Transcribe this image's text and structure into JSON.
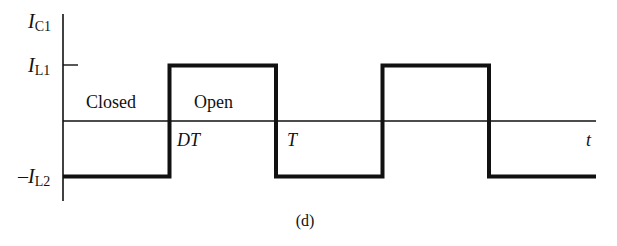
{
  "figure": {
    "caption": "(d)",
    "y_axis": {
      "title_main": "I",
      "title_sub": "C1",
      "levels": [
        {
          "name": "I_L1",
          "main": "I",
          "sub": "L1",
          "prefix": "",
          "value": 1
        },
        {
          "name": "-I_L2",
          "main": "I",
          "sub": "L2",
          "prefix": "–",
          "value": -1
        }
      ]
    },
    "x_axis": {
      "label": "t",
      "ticks": [
        {
          "label": "DT",
          "position": 0.5
        },
        {
          "label": "T",
          "position": 1.0
        }
      ]
    },
    "regions": [
      {
        "label": "Closed"
      },
      {
        "label": "Open"
      }
    ],
    "waveform": {
      "type": "square",
      "period_fraction_D": 0.5,
      "periods_shown": 2,
      "high_level": "I_L1",
      "low_level": "-I_L2",
      "points": [
        [
          0,
          -1
        ],
        [
          0.5,
          -1
        ],
        [
          0.5,
          1
        ],
        [
          1.0,
          1
        ],
        [
          1.0,
          -1
        ],
        [
          1.5,
          -1
        ],
        [
          1.5,
          1
        ],
        [
          2.0,
          1
        ],
        [
          2.0,
          -1
        ],
        [
          2.55,
          -1
        ]
      ]
    },
    "colors": {
      "ink": "#111111",
      "background": "#ffffff"
    }
  }
}
